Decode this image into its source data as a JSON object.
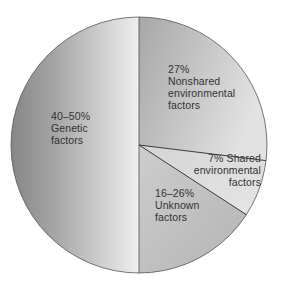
{
  "chart_data": {
    "type": "pie",
    "title": "",
    "start_angle": "top (12 o'clock), clockwise",
    "slices": [
      {
        "name": "Nonshared environmental factors",
        "percent_label": "27%",
        "value": 27,
        "lines": [
          "27%",
          "Nonshared",
          "environmental",
          "factors"
        ],
        "start_deg": 0,
        "end_deg": 97,
        "color_from": "#a9a9a9",
        "color_to": "#dedede"
      },
      {
        "name": "Shared environmental factors",
        "percent_label": "7%",
        "value": 7,
        "lines": [
          "7% Shared",
          "environmental",
          "factors"
        ],
        "start_deg": 97,
        "end_deg": 123,
        "color_from": "#d6d6d6",
        "color_to": "#e4e4e4"
      },
      {
        "name": "Unknown factors",
        "percent_label": "16–26%",
        "value_range": [
          16,
          26
        ],
        "value": 16,
        "lines": [
          "16–26%",
          "Unknown",
          "factors"
        ],
        "start_deg": 123,
        "end_deg": 180,
        "color_from": "#b7b7b7",
        "color_to": "#cbcbcb"
      },
      {
        "name": "Genetic factors",
        "percent_label": "40–50%",
        "value_range": [
          40,
          50
        ],
        "value": 50,
        "lines": [
          "40–50%",
          "Genetic",
          "factors"
        ],
        "start_deg": 180,
        "end_deg": 360,
        "color_from": "#878787",
        "color_to": "#eeeeee"
      }
    ],
    "legend": "none (labels inside slices)",
    "grid": false
  },
  "geometry": {
    "cx": 139,
    "cy": 145,
    "r": 128
  },
  "colors": {
    "outline": "#555555",
    "divider": "#3a3a3a",
    "text": "#333333"
  }
}
